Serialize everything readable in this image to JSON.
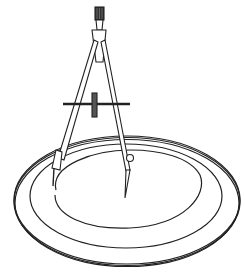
{
  "image": {
    "subject": "Line drawing of a drafting compass drawing a circle on a flat ring",
    "elements": [
      "compass-head-knob",
      "compass-legs",
      "adjustment-screw-bar",
      "needle-point",
      "pencil-holder",
      "inner-arc",
      "ring-outer",
      "ring-inner"
    ],
    "colors": {
      "ink": "#222222",
      "background": "#ffffff"
    }
  }
}
